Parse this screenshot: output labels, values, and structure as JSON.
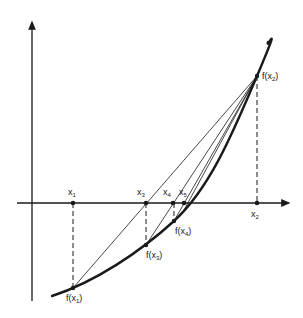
{
  "diagram": {
    "type": "secant method (regula falsi) iteration on convex function",
    "axes": {
      "x_axis": {
        "y": 203,
        "from": 17,
        "to": 291
      },
      "y_axis": {
        "x": 32,
        "from": 300,
        "to": 20
      }
    },
    "curve": {
      "description": "convex increasing function",
      "points": [
        [
          52,
          296
        ],
        [
          73,
          288
        ],
        [
          100,
          276
        ],
        [
          125,
          261
        ],
        [
          146,
          245
        ],
        [
          160,
          234
        ],
        [
          174,
          221
        ],
        [
          184,
          210
        ],
        [
          195,
          196
        ],
        [
          210,
          174
        ],
        [
          225,
          148
        ],
        [
          240,
          117
        ],
        [
          257,
          76
        ],
        [
          263,
          60
        ],
        [
          268,
          42
        ]
      ]
    },
    "points": [
      {
        "name": "x1",
        "label": "x",
        "sub": "1",
        "x": 73,
        "y": 203,
        "fy": 288,
        "f_label": "f(x",
        "f_sub": "1",
        "f_close": ")"
      },
      {
        "name": "x3",
        "label": "x",
        "sub": "3",
        "x": 146,
        "y": 203,
        "fy": 245,
        "f_label": "f(x",
        "f_sub": "3",
        "f_close": ")"
      },
      {
        "name": "x4",
        "label": "x",
        "sub": "4",
        "x": 173,
        "y": 203,
        "fy": 221,
        "f_label": "f(x",
        "f_sub": "4",
        "f_close": ")"
      },
      {
        "name": "x5",
        "label": "x",
        "sub": "5",
        "x": 184,
        "y": 203
      },
      {
        "name": "x2",
        "label": "x",
        "sub": "2",
        "x": 257,
        "y": 203,
        "fy": 76,
        "f_label": "f(x",
        "f_sub": "2",
        "f_close": ")"
      }
    ],
    "secants": [
      {
        "from": "f(x1)",
        "to": "f(x2)",
        "crosses_axis_at": "x3"
      },
      {
        "from": "f(x3)",
        "to": "f(x2)",
        "crosses_axis_at": "x4"
      },
      {
        "from": "f(x4)",
        "to": "f(x2)",
        "crosses_axis_at": "x5"
      },
      {
        "from": "f(x5)",
        "to": "f(x2)"
      }
    ],
    "labels": {
      "x1": {
        "main": "x",
        "sub": "1"
      },
      "x2": {
        "main": "x",
        "sub": "2"
      },
      "x3": {
        "main": "x",
        "sub": "3"
      },
      "x4": {
        "main": "x",
        "sub": "4"
      },
      "x5": {
        "main": "x",
        "sub": "5"
      },
      "fx1": {
        "main": "f(x",
        "sub": "1",
        "close": ")"
      },
      "fx2": {
        "main": "f(x",
        "sub": "2",
        "close": ")"
      },
      "fx3": {
        "main": "f(x",
        "sub": "3",
        "close": ")"
      },
      "fx4": {
        "main": "f(x",
        "sub": "4",
        "close": ")"
      }
    },
    "colors": {
      "ink": "#1a1a1a",
      "background": "#ffffff"
    }
  }
}
